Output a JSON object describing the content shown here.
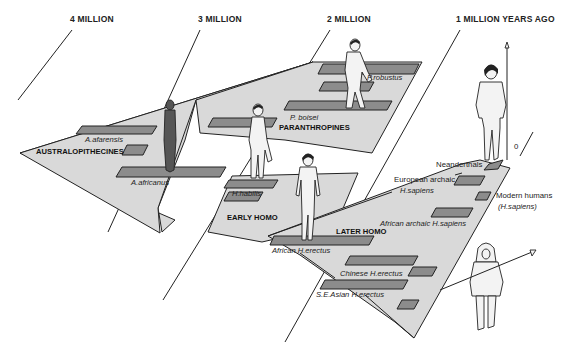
{
  "time_axis": {
    "labels": [
      "4 MILLION",
      "3 MILLION",
      "2 MILLION",
      "1 MILLION  YEARS AGO"
    ],
    "present_marker": "0"
  },
  "groups": {
    "australopithecines": "AUSTRALOPITHECINES",
    "paranthropines": "PARANTHROPINES",
    "early_homo": "EARLY HOMO",
    "later_homo": "LATER HOMO"
  },
  "species": {
    "a_afarensis": "A.afarensis",
    "a_africanus": "A.africanus",
    "p_boisei": "P. boisei",
    "p_robustus": "P.robustus",
    "h_habilis": "H.habilis",
    "african_h_erectus": "African H.erectus",
    "chinese_h_erectus": "Chinese H.erectus",
    "se_asian_h_erectus": "S.E.Asian  H.erectus",
    "african_archaic_h_sapiens": "African archaic H.sapiens",
    "european_archaic_line1": "European archaic",
    "european_archaic_line2": "H.sapiens",
    "neanderthals": "Neanderthals",
    "modern_humans_line1": "Modern humans",
    "modern_humans_line2": "(H.sapiens)"
  },
  "colors": {
    "region_fill": "#d9d9d9",
    "bar_fill": "#8c8c8c",
    "ink": "#222222"
  }
}
